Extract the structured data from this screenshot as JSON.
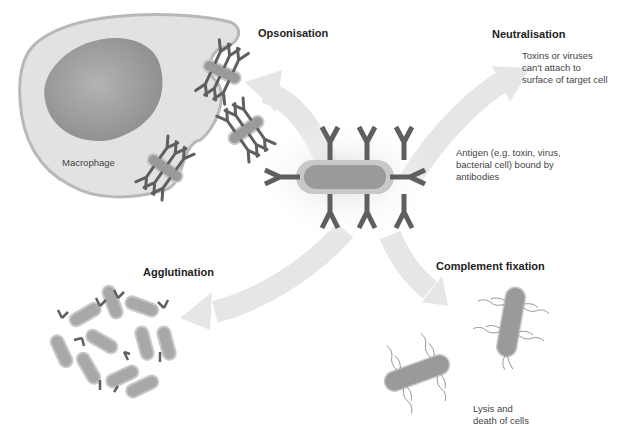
{
  "diagram": {
    "center": {
      "name": "antigen",
      "caption": "Antigen (e.g. toxin, virus,\nbacterial cell) bound by\nantibodies"
    },
    "mechanisms": [
      {
        "id": "opsonisation",
        "title": "Opsonisation",
        "description": ""
      },
      {
        "id": "neutralisation",
        "title": "Neutralisation",
        "description": "Toxins or viruses\ncan't attach to\nsurface of target cell"
      },
      {
        "id": "agglutination",
        "title": "Agglutination",
        "description": ""
      },
      {
        "id": "complement",
        "title": "Complement fixation",
        "description": "Lysis and\ndeath of cells"
      }
    ],
    "macrophage_label": "Macrophage",
    "colors": {
      "background": "#ffffff",
      "arrow": "#e6e6e6",
      "antibody": "#5f5f5f",
      "antigen_fill": "#9a9a9a",
      "antigen_halo": "#c8c8c8",
      "macrophage_fill": "#e2e2e2",
      "macrophage_edge": "#b8b8b8",
      "nucleus": "#a8a8a8"
    }
  }
}
